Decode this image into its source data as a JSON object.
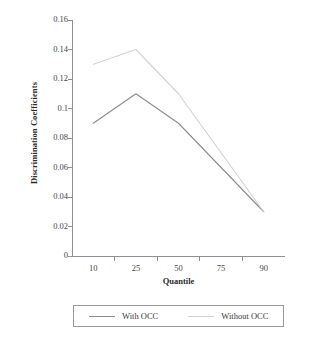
{
  "chart_data": {
    "type": "line",
    "title": "",
    "xlabel": "Quantile",
    "ylabel": "Discrimination Coefficients",
    "categories": [
      "10",
      "25",
      "50",
      "75",
      "90"
    ],
    "x": [
      10,
      25,
      50,
      75,
      90
    ],
    "series": [
      {
        "name": "With OCC",
        "color": "#8b8b90",
        "values": [
          0.09,
          0.11,
          0.09,
          0.06,
          0.03
        ]
      },
      {
        "name": "Without OCC",
        "color": "#d2d2d6",
        "values": [
          0.13,
          0.14,
          0.11,
          0.07,
          0.03
        ]
      }
    ],
    "ylim": [
      0,
      0.16
    ],
    "ytick_labels": [
      "0",
      "0.02",
      "0.04",
      "0.06",
      "0.08",
      "0.1",
      "0.12",
      "0.14",
      "0.16"
    ],
    "ytick_values": [
      0,
      0.02,
      0.04,
      0.06,
      0.08,
      0.1,
      0.12,
      0.14,
      0.16
    ],
    "xtick_labels": [
      "10",
      "25",
      "50",
      "75",
      "90"
    ],
    "grid": false,
    "legend_position": "bottom",
    "axis_color": "#8f8f95",
    "background": "#ffffff"
  },
  "legend": {
    "entries": [
      {
        "label": "With OCC",
        "color": "#8b8b90"
      },
      {
        "label": "Without OCC",
        "color": "#d2d2d6"
      }
    ]
  },
  "axes": {
    "y_title": "Discrimination Coefficients",
    "x_title": "Quantile"
  }
}
